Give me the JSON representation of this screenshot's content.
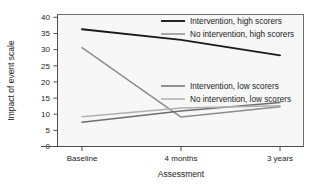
{
  "chart_data": {
    "type": "line",
    "title": "",
    "xlabel": "Assessment",
    "ylabel": "Impact of event scale",
    "categories": [
      "Baseline",
      "4 months",
      "3 years"
    ],
    "xtick_labels": [
      "Baseline",
      "4 months",
      "3 years"
    ],
    "ytick_labels": [
      "0",
      "5",
      "10",
      "15",
      "20",
      "25",
      "30",
      "35",
      "40"
    ],
    "ylim": [
      0,
      41
    ],
    "yticks": [
      0,
      5,
      10,
      15,
      20,
      25,
      30,
      35,
      40
    ],
    "grid": false,
    "legend_position": "inside-right",
    "series": [
      {
        "name": "Intervention, high scorers",
        "values": [
          36.3,
          33.0,
          28.2
        ],
        "color": "#1a1a1a",
        "width": 1.9
      },
      {
        "name": "No intervention, high scorers",
        "values": [
          30.6,
          9.1,
          12.3
        ],
        "color": "#8c8c8c",
        "width": 1.5
      },
      {
        "name": "Intervention, low scorers",
        "values": [
          7.5,
          11.0,
          13.6
        ],
        "color": "#6e6e6e",
        "width": 1.5
      },
      {
        "name": "No intervention, low scorers",
        "values": [
          9.2,
          11.9,
          12.6
        ],
        "color": "#b0b0b0",
        "width": 1.5
      }
    ]
  },
  "axes": {
    "y_title": "Impact of event scale",
    "x_title": "Assessment",
    "ytick_0": "0",
    "ytick_1": "5",
    "ytick_2": "10",
    "ytick_3": "15",
    "ytick_4": "20",
    "ytick_5": "25",
    "ytick_6": "30",
    "ytick_7": "35",
    "ytick_8": "40",
    "xtick_0": "Baseline",
    "xtick_1": "4 months",
    "xtick_2": "3 years"
  },
  "legend": {
    "entry_0": "Intervention, high scorers",
    "entry_1": "No intervention, high scorers",
    "entry_2": "Intervention, low scorers",
    "entry_3": "No intervention, low scorers"
  }
}
